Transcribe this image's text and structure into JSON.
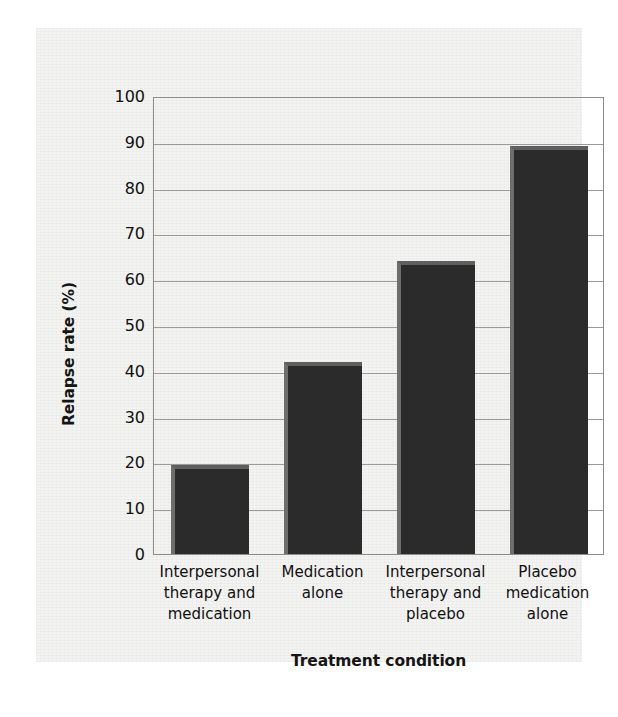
{
  "chart_data": {
    "type": "bar",
    "title": "",
    "xlabel": "Treatment condition",
    "ylabel": "Relapse rate (%)",
    "categories": [
      "Interpersonal therapy and medication",
      "Medication alone",
      "Interpersonal therapy and placebo",
      "Placebo medication alone"
    ],
    "category_lines": [
      [
        "Interpersonal",
        "therapy and",
        "medication"
      ],
      [
        "Medication",
        "alone"
      ],
      [
        "Interpersonal",
        "therapy and",
        "placebo"
      ],
      [
        "Placebo",
        "medication",
        "alone"
      ]
    ],
    "values": [
      19.5,
      42,
      64,
      89
    ],
    "ylim": [
      0,
      100
    ],
    "yticks": [
      0,
      10,
      20,
      30,
      40,
      50,
      60,
      70,
      80,
      90,
      100
    ],
    "ytick_labels": [
      "0",
      "10",
      "20",
      "30",
      "40",
      "50",
      "60",
      "70",
      "80",
      "90",
      "100"
    ],
    "grid": true,
    "legend": false,
    "bar_color": "#2b2b2b",
    "bar_edge_color": "#6e6e6e",
    "gridline_color": "#9a9a9a",
    "axis_color": "#8c8c8c",
    "background_color": "#f3f3f1"
  }
}
